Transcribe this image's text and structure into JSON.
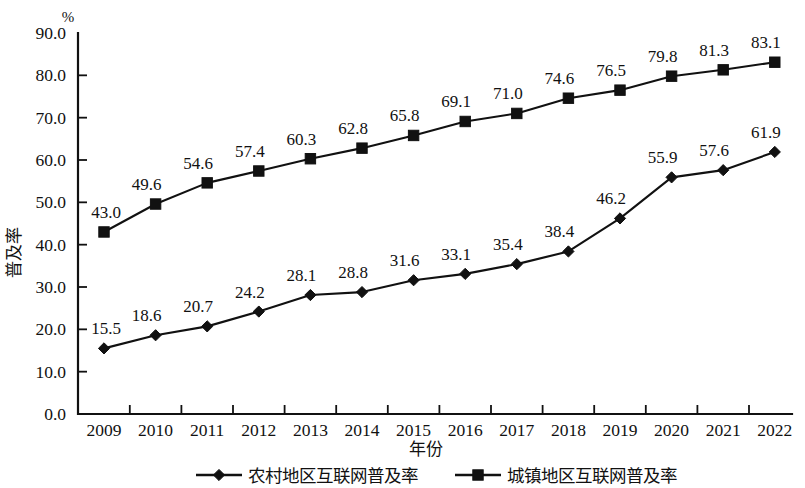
{
  "chart_data": {
    "type": "line",
    "title": "",
    "xlabel": "年份",
    "ylabel": "普及率",
    "unit": "%",
    "ylim": [
      0.0,
      90.0
    ],
    "ytick_labels": [
      "90.0",
      "80.0",
      "70.0",
      "60.0",
      "50.0",
      "40.0",
      "30.0",
      "20.0",
      "10.0",
      "0.0"
    ],
    "ytick_values": [
      90.0,
      80.0,
      70.0,
      60.0,
      50.0,
      40.0,
      30.0,
      20.0,
      10.0,
      0.0
    ],
    "grid": false,
    "legend_position": "bottom",
    "categories": [
      "2009",
      "2010",
      "2011",
      "2012",
      "2013",
      "2014",
      "2015",
      "2016",
      "2017",
      "2018",
      "2019",
      "2020",
      "2021",
      "2022"
    ],
    "series": [
      {
        "name": "农村地区互联网普及率",
        "marker": "diamond",
        "color": "#111111",
        "values": [
          15.5,
          18.6,
          20.7,
          24.2,
          28.1,
          28.8,
          31.6,
          33.1,
          35.4,
          38.4,
          46.2,
          55.9,
          57.6,
          61.9
        ],
        "labels": [
          "15.5",
          "18.6",
          "20.7",
          "24.2",
          "28.1",
          "28.8",
          "31.6",
          "33.1",
          "35.4",
          "38.4",
          "46.2",
          "55.9",
          "57.6",
          "61.9"
        ]
      },
      {
        "name": "城镇地区互联网普及率",
        "marker": "square",
        "color": "#111111",
        "values": [
          43.0,
          49.6,
          54.6,
          57.4,
          60.3,
          62.8,
          65.8,
          69.1,
          71.0,
          74.6,
          76.5,
          79.8,
          81.3,
          83.1
        ],
        "labels": [
          "43.0",
          "49.6",
          "54.6",
          "57.4",
          "60.3",
          "62.8",
          "65.8",
          "69.1",
          "71.0",
          "74.6",
          "76.5",
          "79.8",
          "81.3",
          "83.1"
        ]
      }
    ]
  },
  "legend": {
    "entries": [
      {
        "label": "农村地区互联网普及率",
        "marker": "diamond"
      },
      {
        "label": "城镇地区互联网普及率",
        "marker": "square"
      }
    ]
  },
  "axes": {
    "y_unit": "%",
    "y_title": "普及率",
    "x_title": "年份"
  }
}
